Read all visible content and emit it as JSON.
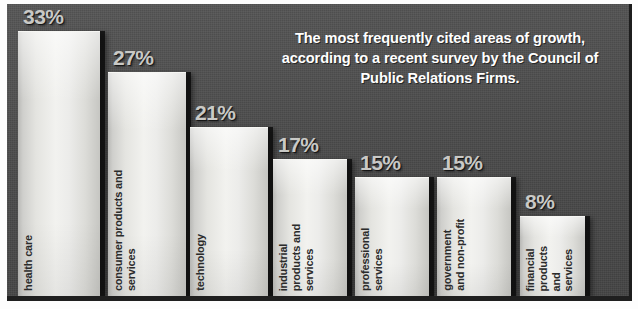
{
  "headline": {
    "text": "The most frequently cited areas of growth, according to a recent survey by the Council of Public Relations Firms."
  },
  "colors": {
    "background": "#4d4d4d",
    "bar_face": "#f2f2ef",
    "bar_shadow": "#0c0c0c",
    "value_label": "#c9c9c6",
    "category_label": "#2b2b2b",
    "headline_text": "#ffffff"
  },
  "chart_data": {
    "type": "bar",
    "title": "The most frequently cited areas of growth, according to a recent survey by the Council of Public Relations Firms.",
    "xlabel": "",
    "ylabel": "",
    "ylim": [
      0,
      38
    ],
    "grid": false,
    "legend": false,
    "unit": "%",
    "categories": [
      "health care",
      "consumer products and\nservices",
      "technology",
      "industrial\nproducts and\nservices",
      "professional\nservices",
      "government\nand non-profit",
      "financial\nproducts\nand\nservices"
    ],
    "values": [
      33,
      27,
      21,
      17,
      15,
      15,
      8
    ],
    "value_labels": [
      "33%",
      "27%",
      "21%",
      "17%",
      "15%",
      "15%",
      "8%"
    ]
  }
}
